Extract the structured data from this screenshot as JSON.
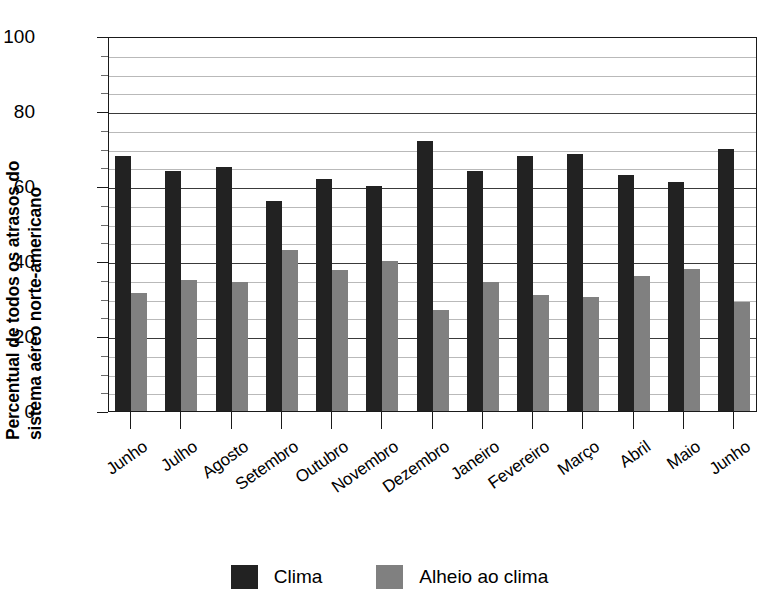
{
  "chart_data": {
    "type": "bar",
    "title": "",
    "xlabel": "",
    "ylabel": "Percentual de todos os atrasos do sistema aéreo norte-americano",
    "ylabel_line1": "Percentual de todos os atrasos do",
    "ylabel_line2": "sistema aéreo norte-americano",
    "ylim": [
      0,
      100
    ],
    "yticks": [
      0,
      20,
      40,
      60,
      80,
      100
    ],
    "ytick_labels": [
      "0",
      "20",
      "40",
      "60",
      "80",
      "100"
    ],
    "minor_gridline_step": 5,
    "grid": true,
    "legend_position": "bottom-center",
    "categories": [
      "Junho",
      "Julho",
      "Agosto",
      "Setembro",
      "Outubro",
      "Novembro",
      "Dezembro",
      "Janeiro",
      "Fevereiro",
      "Março",
      "Abril",
      "Maio",
      "Junho"
    ],
    "series": [
      {
        "name": "Clima",
        "color": "#222222",
        "values": [
          68,
          64,
          65,
          56,
          62,
          60,
          72,
          64,
          68,
          68.5,
          63,
          61,
          70
        ]
      },
      {
        "name": "Alheio ao clima",
        "color": "#808080",
        "values": [
          31.5,
          35,
          34.5,
          43,
          37.5,
          40,
          27,
          34.5,
          31,
          30.5,
          36,
          38,
          29
        ]
      }
    ]
  },
  "legend": {
    "items": [
      {
        "label": "Clima",
        "color": "#222222"
      },
      {
        "label": "Alheio ao clima",
        "color": "#808080"
      }
    ]
  }
}
